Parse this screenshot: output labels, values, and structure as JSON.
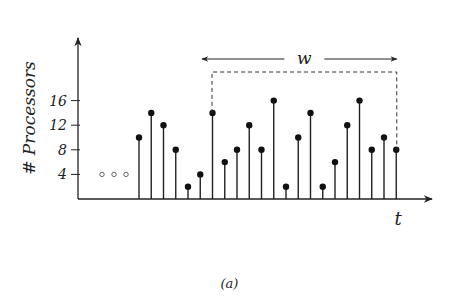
{
  "chart_data": {
    "type": "stem",
    "title": "",
    "xlabel": "t",
    "ylabel": "# Processors",
    "yticks": [
      4,
      8,
      12,
      16
    ],
    "ylim": [
      0,
      20
    ],
    "leading_ellipsis_value": 4,
    "values": [
      10,
      14,
      12,
      8,
      2,
      4,
      14,
      6,
      8,
      12,
      8,
      16,
      2,
      10,
      14,
      2,
      6,
      12,
      16,
      8,
      10,
      8
    ],
    "window": {
      "label": "w",
      "start_index": 6,
      "end_index": 21
    },
    "grid": false,
    "legend": null
  },
  "caption": "(a)",
  "colors": {
    "ink": "#222222",
    "dash": "#333333"
  }
}
